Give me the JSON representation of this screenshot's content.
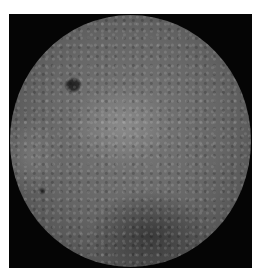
{
  "image": {
    "subject": "Far side of the Moon",
    "background_color": "#050505",
    "margin_color": "#ffffff"
  }
}
